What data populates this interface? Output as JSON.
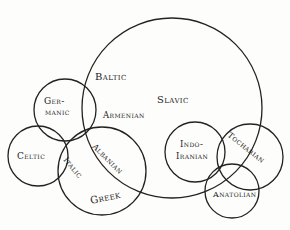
{
  "diagram": {
    "type": "overlapping-circles",
    "title": "",
    "circles": [
      {
        "id": "slavic",
        "cx": 172,
        "cy": 108,
        "r": 90
      },
      {
        "id": "germanic",
        "cx": 65,
        "cy": 110,
        "r": 31
      },
      {
        "id": "celtic",
        "cx": 38,
        "cy": 156,
        "r": 30
      },
      {
        "id": "greek",
        "cx": 102,
        "cy": 171,
        "r": 44
      },
      {
        "id": "indo-iranian",
        "cx": 195,
        "cy": 152,
        "r": 30
      },
      {
        "id": "tocharian",
        "cx": 250,
        "cy": 157,
        "r": 33
      },
      {
        "id": "anatolian",
        "cx": 232,
        "cy": 191,
        "r": 27
      }
    ],
    "labels": {
      "baltic": "Baltic",
      "slavic": "Slavic",
      "germanic_1": "Ger-",
      "germanic_2": "manic",
      "armenian": "Armenian",
      "celtic": "Celtic",
      "italic": "Italic",
      "albanian": "Albanian",
      "greek": "Greek",
      "indo_iranian_1": "Indo-",
      "indo_iranian_2": "Iranian",
      "tocharian": "Tocharian",
      "anatolian": "Anatolian"
    },
    "colors": {
      "stroke": "#222222",
      "text": "#1c1c1c",
      "background": "#fdfdfb"
    }
  }
}
